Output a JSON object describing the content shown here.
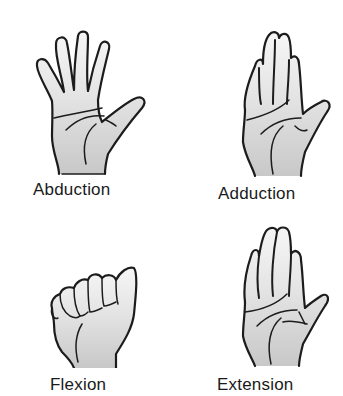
{
  "figure": {
    "panels": [
      {
        "id": "abduction",
        "label": "Abduction",
        "icon": "hand-abduction-icon"
      },
      {
        "id": "adduction",
        "label": "Adduction",
        "icon": "hand-adduction-icon"
      },
      {
        "id": "flexion",
        "label": "Flexion",
        "icon": "hand-flexion-icon"
      },
      {
        "id": "extension",
        "label": "Extension",
        "icon": "hand-extension-icon"
      }
    ],
    "colors": {
      "outline": "#1c1c1c",
      "shading_dark": "#c9c9c9",
      "shading_light": "#f4f4f4",
      "background": "#ffffff"
    }
  }
}
